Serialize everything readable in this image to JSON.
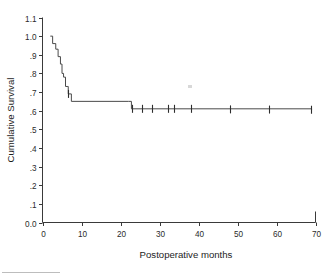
{
  "chart_data": {
    "type": "line",
    "title": "",
    "subtitle": "",
    "xlabel": "Postoperative months",
    "ylabel": "Cumulative Survival",
    "xlim": [
      0,
      70
    ],
    "ylim": [
      0.0,
      1.1
    ],
    "grid": false,
    "legend": null,
    "xticks": [
      0,
      10,
      20,
      30,
      40,
      50,
      60,
      70
    ],
    "xtick_labels": [
      "0",
      "10",
      "20",
      "30",
      "40",
      "50",
      "60",
      "70"
    ],
    "yticks": [
      0.0,
      0.1,
      0.2,
      0.3,
      0.4,
      0.5,
      0.6,
      0.7,
      0.8,
      0.9,
      1.0,
      1.1
    ],
    "ytick_labels": [
      "0.0",
      ".1",
      ".2",
      ".3",
      ".4",
      ".5",
      ".6",
      ".7",
      ".8",
      ".9",
      "1.0",
      "1.1"
    ],
    "series": [
      {
        "name": "Cumulative Survival",
        "style": "step-post",
        "color": "#4a4a4a",
        "x": [
          2.0,
          2.6,
          3.4,
          4.0,
          4.6,
          5.0,
          5.4,
          5.9,
          6.3,
          6.6,
          7.4,
          22.0,
          22.8,
          69.0
        ],
        "y": [
          1.0,
          0.96,
          0.93,
          0.89,
          0.85,
          0.8,
          0.78,
          0.73,
          0.73,
          0.69,
          0.65,
          0.65,
          0.61,
          0.605
        ]
      }
    ],
    "censored_points": [
      {
        "x": 6.5,
        "y": 0.69
      },
      {
        "x": 23.0,
        "y": 0.61
      },
      {
        "x": 25.4,
        "y": 0.61
      },
      {
        "x": 28.0,
        "y": 0.61
      },
      {
        "x": 32.2,
        "y": 0.61
      },
      {
        "x": 33.8,
        "y": 0.61
      },
      {
        "x": 38.0,
        "y": 0.61
      },
      {
        "x": 48.2,
        "y": 0.607
      },
      {
        "x": 58.0,
        "y": 0.606
      },
      {
        "x": 68.8,
        "y": 0.605
      }
    ]
  },
  "axes": {
    "y_title": "Cumulative Survival",
    "x_title": "Postoperative months"
  },
  "colors": {
    "curve": "#4a4a4a",
    "axis": "#3a3a3a",
    "text": "#1d1d1d",
    "background": "#ffffff"
  }
}
